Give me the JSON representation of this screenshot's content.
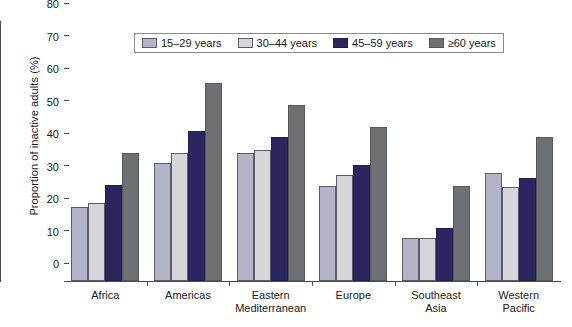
{
  "chart_data": {
    "type": "bar",
    "title": "",
    "xlabel": "",
    "ylabel": "Proportion of inactive adults (%)",
    "ylim": [
      0,
      80
    ],
    "yticks": [
      0,
      10,
      20,
      30,
      40,
      50,
      60,
      70,
      80
    ],
    "grid": false,
    "legend_position": "top-center",
    "categories": [
      "Africa",
      "Americas",
      "Eastern\nMediterranean",
      "Europe",
      "Southeast\nAsia",
      "Western\nPacific"
    ],
    "series": [
      {
        "name": "15–29 years",
        "color": "#b3b4c8",
        "values": [
          22.8,
          36.4,
          39.3,
          29.2,
          13.3,
          33.2
        ]
      },
      {
        "name": "30–44 years",
        "color": "#d4d6da",
        "values": [
          23.9,
          39.4,
          40.3,
          32.7,
          13.1,
          28.9
        ]
      },
      {
        "name": "45–59 years",
        "color": "#2b2560",
        "values": [
          29.6,
          46.1,
          44.2,
          35.7,
          16.2,
          31.7
        ]
      },
      {
        "name": "≥60 years",
        "color": "#6e7174",
        "values": [
          39.4,
          60.9,
          54.2,
          47.5,
          29.1,
          44.4
        ]
      }
    ]
  },
  "axis": {
    "y_title": "Proportion of inactive adults (%)"
  }
}
